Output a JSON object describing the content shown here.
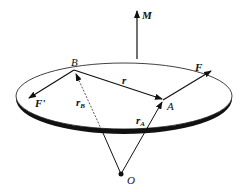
{
  "diagram": {
    "title": "",
    "labels": {
      "moment": "M",
      "point_b": "B",
      "point_a": "A",
      "origin": "O",
      "force_f": "F",
      "force_f_prime": "F'",
      "vector_r": "r",
      "vector_rb_main": "r",
      "vector_rb_sub": "B",
      "vector_ra_main": "r",
      "vector_ra_sub": "A"
    },
    "colors": {
      "stroke": "#111111",
      "background": "#ffffff"
    }
  }
}
